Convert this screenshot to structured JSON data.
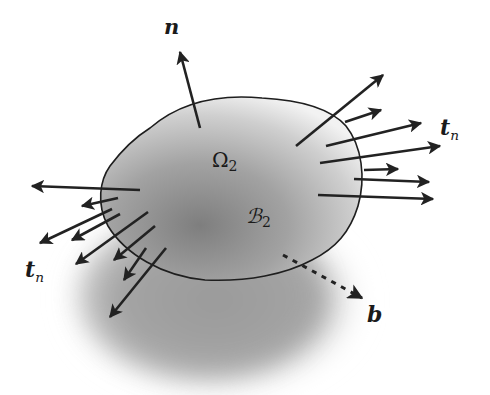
{
  "figure": {
    "colors": {
      "background": "#ffffff",
      "body_fill_dark": "#8a8a8a",
      "body_fill_light": "#e6e6e6",
      "shadow": "#9a9a9a",
      "outline": "#1e1e1e",
      "arrow": "#222222"
    },
    "labels": {
      "normal": {
        "main": "n",
        "x": 166,
        "y": 22
      },
      "region": {
        "main": "Ω",
        "sub": "2",
        "x": 213,
        "y": 155
      },
      "body": {
        "main": "ℬ",
        "sub": "2",
        "x": 248,
        "y": 212
      },
      "traction_right": {
        "main": "t",
        "sub": "n",
        "x": 440,
        "y": 122
      },
      "traction_left": {
        "main": "t",
        "sub": "n",
        "x": 25,
        "y": 262
      },
      "body_force": {
        "main": "b",
        "x": 368,
        "y": 307
      }
    },
    "arrows": {
      "normal": [
        {
          "x1": 200,
          "y1": 128,
          "x2": 180,
          "y2": 52
        }
      ],
      "traction_right": [
        {
          "x1": 296,
          "y1": 146,
          "x2": 383,
          "y2": 75
        },
        {
          "x1": 345,
          "y1": 122,
          "x2": 381,
          "y2": 110
        },
        {
          "x1": 326,
          "y1": 146,
          "x2": 421,
          "y2": 123
        },
        {
          "x1": 320,
          "y1": 163,
          "x2": 440,
          "y2": 146
        },
        {
          "x1": 364,
          "y1": 170,
          "x2": 398,
          "y2": 169
        },
        {
          "x1": 354,
          "y1": 179,
          "x2": 429,
          "y2": 182
        },
        {
          "x1": 318,
          "y1": 195,
          "x2": 433,
          "y2": 199
        }
      ],
      "traction_left": [
        {
          "x1": 140,
          "y1": 190,
          "x2": 32,
          "y2": 186
        },
        {
          "x1": 118,
          "y1": 198,
          "x2": 82,
          "y2": 206
        },
        {
          "x1": 112,
          "y1": 209,
          "x2": 40,
          "y2": 243
        },
        {
          "x1": 120,
          "y1": 214,
          "x2": 72,
          "y2": 240
        },
        {
          "x1": 148,
          "y1": 212,
          "x2": 76,
          "y2": 264
        },
        {
          "x1": 155,
          "y1": 226,
          "x2": 114,
          "y2": 260
        },
        {
          "x1": 146,
          "y1": 248,
          "x2": 124,
          "y2": 280
        },
        {
          "x1": 166,
          "y1": 248,
          "x2": 110,
          "y2": 317
        }
      ],
      "body_force": [
        {
          "x1": 283,
          "y1": 255,
          "x2": 362,
          "y2": 298,
          "dashed": true
        }
      ]
    }
  }
}
